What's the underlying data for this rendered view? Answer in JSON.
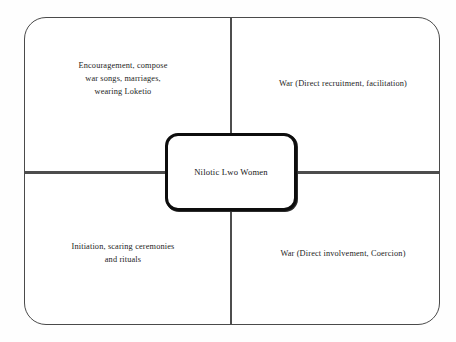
{
  "diagram": {
    "center": {
      "label": "Nilotic Lwo Women"
    },
    "quadrants": [
      {
        "position": "top-left",
        "name": "encouragement",
        "lines": [
          "Encouragement, compose",
          "war songs, marriages,",
          "wearing Loketio"
        ]
      },
      {
        "position": "top-right",
        "name": "war-recruitment",
        "lines": [
          "War (Direct recruitment, facilitation)"
        ]
      },
      {
        "position": "bottom-left",
        "name": "initiation",
        "lines": [
          "Initiation, scaring ceremonies",
          "and rituals"
        ]
      },
      {
        "position": "bottom-right",
        "name": "war-involvement",
        "lines": [
          "War (Direct involvement, Coercion)"
        ]
      }
    ],
    "colors": {
      "frame_stroke": "#4a4a4a",
      "divider_stroke": "#4d4d4d",
      "center_stroke": "#0d0d0d",
      "background": "#ffffff",
      "text": "#1c1c1c"
    }
  }
}
